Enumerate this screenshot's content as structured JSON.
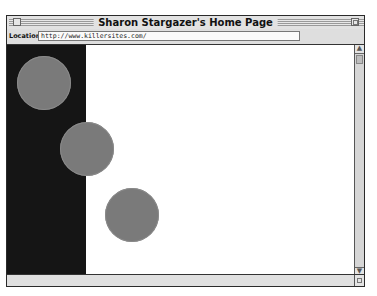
{
  "window": {
    "title": "Sharon Stargazer's Home Page"
  },
  "location_bar": {
    "label": "Location:",
    "url": "http://www.killersites.com/"
  },
  "page": {
    "left_column_color": "#151515",
    "background_color": "#ffffff",
    "circle_color": "#7a7a7a",
    "circles": [
      {
        "cx": 37,
        "cy": 38,
        "r": 27
      },
      {
        "cx": 80,
        "cy": 104,
        "r": 27
      },
      {
        "cx": 125,
        "cy": 170,
        "r": 27
      }
    ]
  },
  "scrollbar": {
    "up_icon": "▲",
    "down_icon": "▼"
  }
}
